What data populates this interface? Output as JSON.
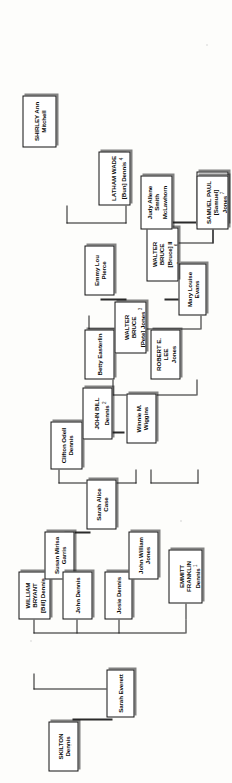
{
  "document": {
    "type": "family-tree-chart",
    "orientation": "rotated-90-ccw",
    "background_color": "#fdfdfb",
    "box_border_color": "#101010",
    "box_fill_color": "#ffffff",
    "text_color": "#0b0b0b"
  },
  "nodes": {
    "skilton_dennis": {
      "name": "SKILTON Dennis",
      "index": ""
    },
    "sarah_everett": {
      "name": "Sarah Everett",
      "index": ""
    },
    "william_bryant": {
      "name": "WILLIAM BRYANT\n[Bill] Dennis",
      "index": ""
    },
    "susan_mirna_garris": {
      "name": "Susan Mirisa\nGarris",
      "index": ""
    },
    "john_dennis": {
      "name": "John Dennis",
      "index": ""
    },
    "sarah_alice_case": {
      "name": "Sarah Alice Case",
      "index": ""
    },
    "clifton_odell": {
      "name": "Clifton Odell\nDennis",
      "index": ""
    },
    "winnie_wiggins": {
      "name": "Winnie M. Wiggins",
      "index": ""
    },
    "latham_wade": {
      "name": "LATHAM WADE\n[Bun] Dennis",
      "index": "4"
    },
    "shirley_ann": {
      "name": "SHIRLEY Ann\nMitchell",
      "index": ""
    },
    "john_bill_dennis": {
      "name": "JOHN BILL Dennis",
      "index": "2"
    },
    "betty_easterlin": {
      "name": "Betty Easterlin",
      "index": ""
    },
    "emmitt_franklin": {
      "name": "EMMITT FRANKLIN\nDennis",
      "index": "1"
    },
    "josie_dennis": {
      "name": "Josie Dennis",
      "index": ""
    },
    "john_william_jones": {
      "name": "John William\nJones",
      "index": ""
    },
    "robert_e_lee_jones": {
      "name": "ROBERT E. LEE\nJones",
      "index": ""
    },
    "mary_louise_evans": {
      "name": "Mary Louise Evans",
      "index": ""
    },
    "robert_jeffrey": {
      "name": "ROBERT JEFFREY\n[Jeff] Jones",
      "index": "5"
    },
    "walter_bruce_pete": {
      "name": "WALTER BRUCE\n[Pete] Jones",
      "index": "3"
    },
    "emmy_lou_pierce": {
      "name": "Emmy Lou Pierce",
      "index": ""
    },
    "walter_bruce_ii": {
      "name": "WALTER BRUCE\n[Bruce] II Jones",
      "index": "6"
    },
    "judy_allene_smith": {
      "name": "Judy Allene Smith\nMcLawhorn",
      "index": ""
    },
    "samuel_paul": {
      "name": "SAMUEL PAUL\n[Samuel] Jones",
      "index": "7"
    }
  }
}
